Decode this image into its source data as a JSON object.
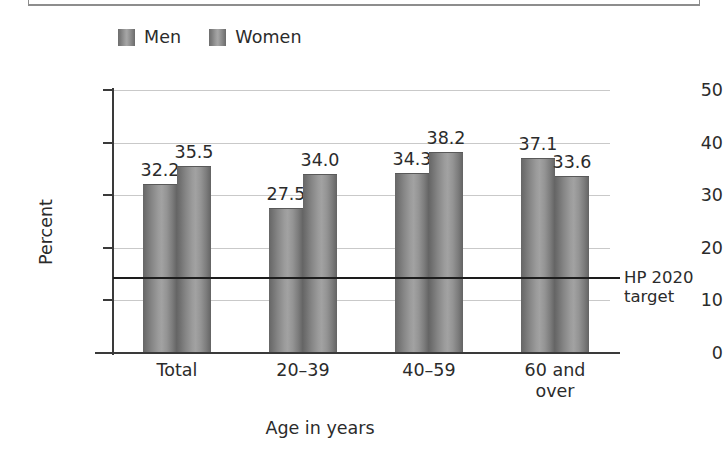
{
  "chart_data": {
    "type": "bar",
    "title": "",
    "xlabel": "Age in years",
    "ylabel": "Percent",
    "categories": [
      "Total",
      "20–39",
      "40–59",
      "60 and\nover"
    ],
    "series": [
      {
        "name": "Men",
        "values": [
          32.2,
          27.5,
          34.3,
          37.1
        ]
      },
      {
        "name": "Women",
        "values": [
          35.5,
          34.0,
          38.2,
          33.6
        ]
      }
    ],
    "ylim": [
      0,
      50
    ],
    "yticks": [
      0,
      10,
      20,
      30,
      40,
      50
    ],
    "ytick_labels": [
      "0",
      "10",
      "20",
      "30",
      "40",
      "50"
    ],
    "grid": "horizontal",
    "legend_position": "top-left",
    "reference_line": {
      "value": 14.5,
      "label": "HP 2020\ntarget",
      "color": "#1d1d1d"
    },
    "value_labels": [
      "32.2",
      "35.5",
      "27.5",
      "34.0",
      "34.3",
      "38.2",
      "37.1",
      "33.6"
    ],
    "colors": {
      "men_bar": "#8a8a8a",
      "women_bar": "#8a8a8a",
      "gridline": "#c9c9c9",
      "axis": "#3a3a3a",
      "text": "#2b2b2b"
    }
  },
  "legend": {
    "items": [
      {
        "label": "Men",
        "swatch": "legend-swatch-men"
      },
      {
        "label": "Women",
        "swatch": "legend-swatch-women"
      }
    ]
  }
}
